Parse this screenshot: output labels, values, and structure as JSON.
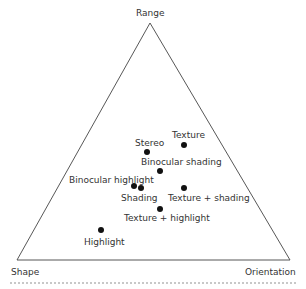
{
  "diagram": {
    "type": "ternary-triangle",
    "vertices": {
      "top": "Range",
      "bottom_left": "Shape",
      "bottom_right": "Orientation"
    },
    "points": [
      {
        "label": "Texture",
        "x": 184,
        "y": 145,
        "lx": 172,
        "ly": 131
      },
      {
        "label": "Stereo",
        "x": 147,
        "y": 152,
        "lx": 135,
        "ly": 139
      },
      {
        "label": "Binocular shading",
        "x": 160,
        "y": 171,
        "lx": 141,
        "ly": 158
      },
      {
        "label": "Binocular highlight",
        "x": 134,
        "y": 186,
        "lx": 69,
        "ly": 176
      },
      {
        "label": "Shading",
        "x": 141,
        "y": 188,
        "lx": 121,
        "ly": 194
      },
      {
        "label": "Texture + shading",
        "x": 184,
        "y": 188,
        "lx": 168,
        "ly": 194
      },
      {
        "label": "Texture + highlight",
        "x": 160,
        "y": 209,
        "lx": 124,
        "ly": 214
      },
      {
        "label": "Highlight",
        "x": 101,
        "y": 230,
        "lx": 84,
        "ly": 238
      }
    ]
  }
}
